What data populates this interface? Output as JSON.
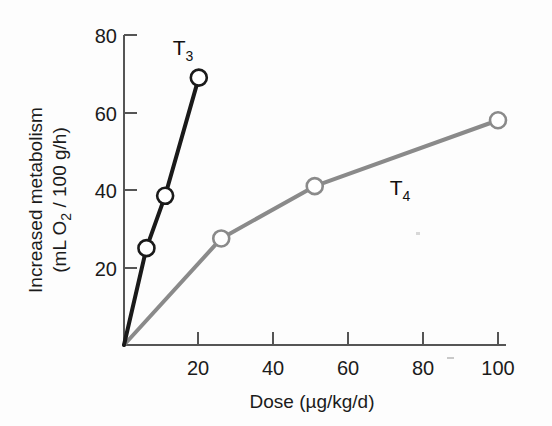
{
  "chart_data": {
    "type": "line",
    "title": "",
    "xlabel": "Dose (µg/kg/d)",
    "ylabel_line1": "Increased metabolism",
    "ylabel_line2_prefix": "(mL O",
    "ylabel_line2_sub": "2",
    "ylabel_line2_suffix": " / 100 g/h)",
    "xlim": [
      0,
      105
    ],
    "ylim": [
      0,
      84
    ],
    "xticks": [
      20,
      40,
      60,
      80,
      100
    ],
    "yticks": [
      20,
      40,
      60,
      80
    ],
    "xtick_labels": [
      "20",
      "40",
      "60",
      "80",
      "100"
    ],
    "ytick_labels": [
      "20",
      "40",
      "60",
      "80"
    ],
    "grid": false,
    "legend": "inline-annotations",
    "series": [
      {
        "name": "T3",
        "label_base": "T",
        "label_sub": "3",
        "color": "#1a1a1a",
        "linewidth": 4,
        "marker": "open-circle",
        "x": [
          0,
          6,
          11,
          20
        ],
        "y": [
          0,
          25,
          38.5,
          69
        ],
        "label_x": 20,
        "label_y": 78
      },
      {
        "name": "T4",
        "label_base": "T",
        "label_sub": "4",
        "color": "#8a8a8a",
        "linewidth": 4,
        "marker": "open-circle",
        "x": [
          0,
          26,
          51,
          100
        ],
        "y": [
          0,
          27.5,
          41,
          58
        ],
        "label_x": 75,
        "label_y": 45
      }
    ]
  },
  "annotations": {
    "t3_label_base": "T",
    "t3_label_sub": "3",
    "t4_label_base": "T",
    "t4_label_sub": "4"
  },
  "axis": {
    "x_title": "Dose (µg/kg/d)",
    "y_title_line1": "Increased metabolism",
    "y_title_line2_a": "(mL O",
    "y_title_line2_b": "2",
    "y_title_line2_c": " / 100 g/h)",
    "x_tick_0": "20",
    "x_tick_1": "40",
    "x_tick_2": "60",
    "x_tick_3": "80",
    "x_tick_4": "100",
    "y_tick_0": "20",
    "y_tick_1": "40",
    "y_tick_2": "60",
    "y_tick_3": "80"
  },
  "colors": {
    "t3": "#1a1a1a",
    "t4": "#8a8a8a",
    "axis": "#555555",
    "background": "#fdfdfd",
    "marker_fill": "#ffffff"
  }
}
